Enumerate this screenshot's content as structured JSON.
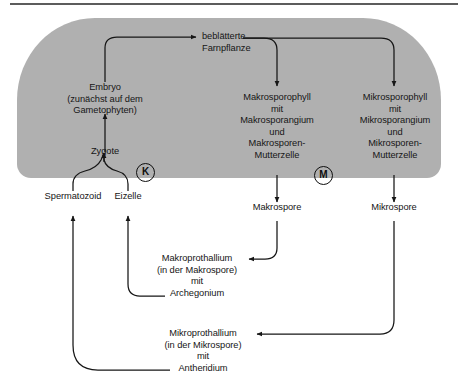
{
  "figure": {
    "background_color": "#ffffff",
    "band_color": "#b0b0b0",
    "line_color": "#161616",
    "rule_color": "#5c5c5c"
  },
  "nodes": {
    "farnpflanze": {
      "lines": [
        "beblätterte",
        "Farnpflanze"
      ]
    },
    "embryo": {
      "lines": [
        "Embryo",
        "(zunächst auf dem",
        "Gametophyten)"
      ]
    },
    "zygote": {
      "lines": [
        "Zygote"
      ]
    },
    "makrosporophyll": {
      "lines": [
        "Makrosporophyll",
        "mit",
        "Makrosporangium",
        "und",
        "Makrosporen-",
        "Mutterzelle"
      ]
    },
    "mikrosporophyll": {
      "lines": [
        "Mikrosporophyll",
        "mit",
        "Mikrosporangium",
        "und",
        "Mikrosporen-",
        "Mutterzelle"
      ]
    },
    "spermatozoid": {
      "lines": [
        "Spermatozoid"
      ]
    },
    "eizelle": {
      "lines": [
        "Eizelle"
      ]
    },
    "makrospore": {
      "lines": [
        "Makrospore"
      ]
    },
    "mikrospore": {
      "lines": [
        "Mikrospore"
      ]
    },
    "makroprothallium": {
      "lines": [
        "Makroprothallium",
        "(in der Makrospore)",
        "mit",
        "Archegonium"
      ]
    },
    "mikroprothallium": {
      "lines": [
        "Mikroprothallium",
        "(in der Mikrospore)",
        "mit",
        "Antheridium"
      ]
    }
  },
  "markers": [
    {
      "key": "karyogamie",
      "label": "K"
    },
    {
      "key": "meiose",
      "label": "M"
    }
  ]
}
